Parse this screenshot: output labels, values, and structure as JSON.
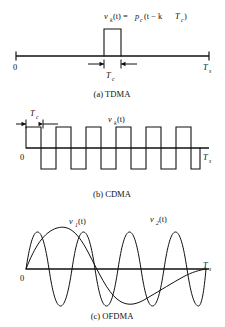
{
  "figure": {
    "panels": [
      {
        "id": "tdma",
        "caption": "(a) TDMA",
        "equation": {
          "lhs_var": "v",
          "lhs_sub": "k",
          "lhs_arg": "(t) =",
          "rhs_var": "p",
          "rhs_sub": "c",
          "rhs_arg_open": "(t − k",
          "rhs_inner_var": "T",
          "rhs_inner_sub": "c",
          "rhs_arg_close": ")",
          "full_text": "v_k(t) = p_c (t − kT_c)"
        },
        "axis_origin_label": "0",
        "axis_end_var": "T",
        "axis_end_sub": "s",
        "dimension_var": "T",
        "dimension_sub": "c",
        "description": "Single rectangular pulse of width T_c located in the k-th slot of the symbol interval [0, T_s]"
      },
      {
        "id": "cdma",
        "caption": "(b) CDMA",
        "signal_var": "v",
        "signal_sub": "k",
        "signal_arg": "(t)",
        "signal_full_text": "v_k(t)",
        "axis_origin_label": "0",
        "axis_end_var": "T",
        "axis_end_sub": "s",
        "dimension_var": "T",
        "dimension_sub": "c",
        "chip_sequence": [
          1,
          -1,
          1,
          -1,
          1,
          -1,
          -1,
          1,
          -1,
          1,
          -1,
          1
        ],
        "description": "Bipolar chip (spreading code) waveform of chip duration T_c spanning the symbol interval [0, T_s]"
      },
      {
        "id": "ofdma",
        "caption": "(c) OFDMA",
        "axis_origin_label": "0",
        "axis_end_var": "T",
        "axis_end_sub": "s",
        "subcarriers": [
          {
            "label_var": "v",
            "label_sub": "1",
            "label_arg": "(t)",
            "label_full_text": "v_1(t)",
            "cycles": 1
          },
          {
            "label_var": "v",
            "label_sub": "2",
            "label_arg": "(t)",
            "label_full_text": "v_2(t)",
            "cycles": 6
          }
        ],
        "description": "Two orthogonal sinusoidal subcarriers over the symbol interval [0, T_s]"
      }
    ],
    "colors": {
      "ink": "#111111",
      "background": "#ffffff"
    }
  }
}
